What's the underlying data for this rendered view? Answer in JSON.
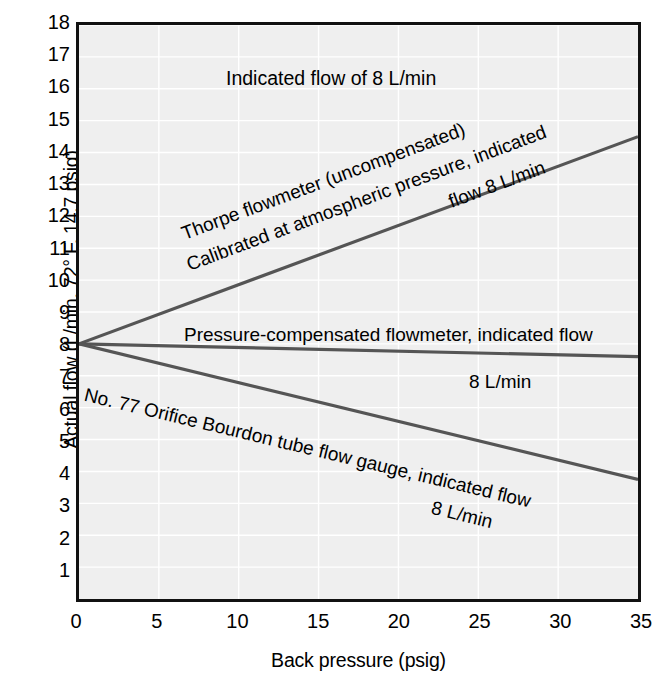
{
  "chart_data": {
    "type": "line",
    "title": "",
    "xlabel": "Back pressure (psig)",
    "ylabel": "Actual flow (L/min, 72° F, 14.7 psig)",
    "xlim": [
      0,
      35
    ],
    "ylim": [
      0,
      18
    ],
    "xticks": [
      0,
      5,
      10,
      15,
      20,
      25,
      30,
      35
    ],
    "yticks": [
      1,
      2,
      3,
      4,
      5,
      6,
      7,
      8,
      9,
      10,
      11,
      12,
      13,
      14,
      15,
      16,
      17,
      18
    ],
    "grid": true,
    "legend_position": "none",
    "x": [
      0,
      35
    ],
    "series": [
      {
        "name": "Thorpe flowmeter (uncompensated), calibrated at atmospheric pressure, indicated flow 8 L/min",
        "values": [
          8.0,
          14.5
        ],
        "color": "#555555"
      },
      {
        "name": "Pressure-compensated flowmeter, indicated flow 8 L/min",
        "values": [
          8.0,
          7.6
        ],
        "color": "#555555"
      },
      {
        "name": "No. 77 Orifice Bourdon tube flow gauge, indicated flow 8 L/min",
        "values": [
          8.0,
          3.75
        ],
        "color": "#555555"
      }
    ],
    "annotations": [
      {
        "id": "title",
        "text": "Indicated flow of 8 L/min"
      },
      {
        "id": "thorpe_line1",
        "text": "Thorpe flowmeter (uncompensated)"
      },
      {
        "id": "thorpe_line2a",
        "text": "Calibrated at atmospheric pressure, indicated"
      },
      {
        "id": "thorpe_line2b",
        "text": "flow 8 L/min"
      },
      {
        "id": "pc_line1",
        "text": "Pressure-compensated flowmeter, indicated flow"
      },
      {
        "id": "pc_line2",
        "text": "8 L/min"
      },
      {
        "id": "orifice_line1",
        "text": "No. 77 Orifice Bourdon tube flow gauge, indicated flow"
      },
      {
        "id": "orifice_line2",
        "text": "8 L/min"
      }
    ]
  },
  "axes": {
    "y_title": "Actual flow (L/min, 72° F, 14.7 psig)",
    "x_title": "Back pressure (psig)",
    "y_tick_labels": [
      "18",
      "17",
      "16",
      "15",
      "14",
      "13",
      "12",
      "11",
      "10",
      "9",
      "8",
      "7",
      "6",
      "5",
      "4",
      "3",
      "2",
      "1"
    ],
    "x_tick_labels": [
      "0",
      "5",
      "10",
      "15",
      "20",
      "25",
      "30",
      "35"
    ]
  },
  "annotations": {
    "title": "Indicated flow of 8 L/min",
    "thorpe_line1": "Thorpe flowmeter (uncompensated)",
    "thorpe_line2a": "Calibrated at atmospheric pressure, indicated",
    "thorpe_line2b": "flow 8 L/min",
    "pc_line1": "Pressure-compensated flowmeter, indicated flow",
    "pc_line2": "8 L/min",
    "orifice_line1": "No. 77 Orifice Bourdon tube flow gauge, indicated flow",
    "orifice_line2": "8 L/min"
  },
  "style": {
    "plot_background": "#efefef",
    "frame_color": "#111111",
    "grid_color": "#ffffff",
    "line_color": "#555555",
    "text_color": "#000000"
  }
}
